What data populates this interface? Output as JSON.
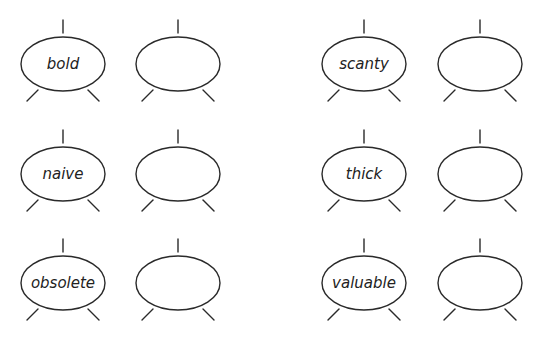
{
  "diagram": {
    "title": "",
    "type": "word-web exercise",
    "stroke_color": "#2a2a2a",
    "text_color": "#222222",
    "ellipse": {
      "rx": 42,
      "ry": 27
    },
    "rows": [
      {
        "cy": 64,
        "pairs": [
          {
            "word": "bold",
            "cx_word": 63,
            "cx_blank": 178
          },
          {
            "word": "scanty",
            "cx_word": 364,
            "cx_blank": 480
          }
        ]
      },
      {
        "cy": 174,
        "pairs": [
          {
            "word": "naive",
            "cx_word": 63,
            "cx_blank": 178
          },
          {
            "word": "thick",
            "cx_word": 364,
            "cx_blank": 480
          }
        ]
      },
      {
        "cy": 283,
        "pairs": [
          {
            "word": "obsolete",
            "cx_word": 63,
            "cx_blank": 178
          },
          {
            "word": "valuable",
            "cx_word": 364,
            "cx_blank": 480
          }
        ]
      }
    ],
    "words": {
      "w1": "bold",
      "w2": "scanty",
      "w3": "naive",
      "w4": "thick",
      "w5": "obsolete",
      "w6": "valuable"
    },
    "blank_ellipses": 6
  }
}
